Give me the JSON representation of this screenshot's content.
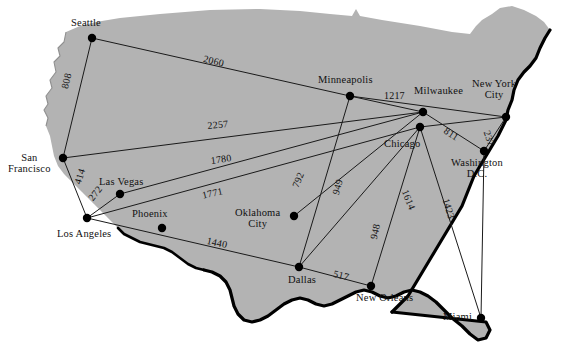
{
  "figure": {
    "kind": "weighted-graph-on-us-map",
    "land_fill": "#b3b3b3",
    "coast_stroke": "#000000",
    "edge_stroke": "#1a1a1a",
    "node_fill": "#000000",
    "background": "#ffffff"
  },
  "chart_data": {
    "type": "network-graph",
    "title": "",
    "xlabel": "",
    "ylabel": "",
    "units": "miles",
    "nodes": [
      {
        "id": "seattle",
        "label": "Seattle",
        "x": 92,
        "y": 38,
        "label_x": 71,
        "label_y": 17,
        "align": "left"
      },
      {
        "id": "san_francisco",
        "label": "San\nFrancisco",
        "x": 63,
        "y": 158,
        "label_x": 8,
        "label_y": 152,
        "align": "center"
      },
      {
        "id": "los_angeles",
        "label": "Los Angeles",
        "x": 87,
        "y": 218,
        "label_x": 57,
        "label_y": 228,
        "align": "left"
      },
      {
        "id": "las_vegas",
        "label": "Las Vegas",
        "x": 120,
        "y": 194,
        "label_x": 99,
        "label_y": 176,
        "align": "left"
      },
      {
        "id": "phoenix",
        "label": "Phoenix",
        "x": 162,
        "y": 228,
        "label_x": 132,
        "label_y": 208,
        "align": "left"
      },
      {
        "id": "dallas",
        "label": "Dallas",
        "x": 299,
        "y": 267,
        "label_x": 288,
        "label_y": 274,
        "align": "left"
      },
      {
        "id": "oklahoma_city",
        "label": "Oklahoma\nCity",
        "x": 294,
        "y": 216,
        "label_x": 235,
        "label_y": 207,
        "align": "center"
      },
      {
        "id": "minneapolis",
        "label": "Minneapolis",
        "x": 350,
        "y": 96,
        "label_x": 318,
        "label_y": 74,
        "align": "left"
      },
      {
        "id": "milwaukee",
        "label": "Milwaukee",
        "x": 423,
        "y": 112,
        "label_x": 414,
        "label_y": 85,
        "align": "left"
      },
      {
        "id": "chicago",
        "label": "Chicago",
        "x": 420,
        "y": 127,
        "label_x": 384,
        "label_y": 138,
        "align": "left"
      },
      {
        "id": "new_york_city",
        "label": "New York\nCity",
        "x": 506,
        "y": 117,
        "label_x": 472,
        "label_y": 78,
        "align": "center"
      },
      {
        "id": "washington_dc",
        "label": "Washington\nD.C.",
        "x": 484,
        "y": 151,
        "label_x": 451,
        "label_y": 157,
        "align": "center"
      },
      {
        "id": "new_orleans",
        "label": "New Orleans",
        "x": 371,
        "y": 286,
        "label_x": 356,
        "label_y": 292,
        "align": "left"
      },
      {
        "id": "miami",
        "label": "Miami",
        "x": 481,
        "y": 318,
        "label_x": 443,
        "label_y": 311,
        "align": "left"
      }
    ],
    "edges": [
      {
        "from": "seattle",
        "to": "minneapolis",
        "weight": 2060,
        "label_x": 205,
        "label_y": 53,
        "rotate": 14
      },
      {
        "from": "seattle",
        "to": "san_francisco",
        "weight": 808,
        "label_x": 59,
        "label_y": 87,
        "rotate": -76
      },
      {
        "from": "san_francisco",
        "to": "milwaukee",
        "weight": 2257,
        "label_x": 207,
        "label_y": 120,
        "rotate": -5
      },
      {
        "from": "san_francisco",
        "to": "los_angeles",
        "weight": 414,
        "label_x": 72,
        "label_y": 182,
        "rotate": -73
      },
      {
        "from": "las_vegas",
        "to": "milwaukee",
        "weight": 1780,
        "label_x": 210,
        "label_y": 155,
        "rotate": -8
      },
      {
        "from": "los_angeles",
        "to": "las_vegas",
        "weight": 272,
        "label_x": 86,
        "label_y": 196,
        "rotate": -52
      },
      {
        "from": "los_angeles",
        "to": "chicago",
        "weight": 1771,
        "label_x": 201,
        "label_y": 190,
        "rotate": -13
      },
      {
        "from": "los_angeles",
        "to": "dallas",
        "weight": 1440,
        "label_x": 208,
        "label_y": 235,
        "rotate": 12
      },
      {
        "from": "oklahoma_city",
        "to": "milwaukee",
        "weight": 792,
        "label_x": 290,
        "label_y": 185,
        "rotate": -68
      },
      {
        "from": "dallas",
        "to": "minneapolis",
        "weight": 949,
        "label_x": 330,
        "label_y": 193,
        "rotate": -75
      },
      {
        "from": "minneapolis",
        "to": "milwaukee",
        "weight": 1217,
        "label_x": 384,
        "label_y": 90,
        "rotate": 0
      },
      {
        "from": "milwaukee",
        "to": "washington_dc",
        "weight": 811,
        "label_x": 448,
        "label_y": 125,
        "rotate": 33
      },
      {
        "from": "new_york_city",
        "to": "washington_dc",
        "weight": 237,
        "label_x": 492,
        "label_y": 129,
        "rotate": 70
      },
      {
        "from": "chicago",
        "to": "miami",
        "weight": 1614,
        "label_x": 410,
        "label_y": 188,
        "rotate": 68
      },
      {
        "from": "washington_dc",
        "to": "miami",
        "weight": 1423,
        "label_x": 451,
        "label_y": 197,
        "rotate": 73
      },
      {
        "from": "chicago",
        "to": "new_orleans",
        "weight": 948,
        "label_x": 368,
        "label_y": 238,
        "rotate": -78
      },
      {
        "from": "dallas",
        "to": "new_orleans",
        "weight": 517,
        "label_x": 335,
        "label_y": 268,
        "rotate": 14
      },
      {
        "from": "dallas",
        "to": "chicago",
        "weight": null,
        "label_x": 0,
        "label_y": 0,
        "rotate": 0
      },
      {
        "from": "new_york_city",
        "to": "minneapolis",
        "weight": null,
        "label_x": 0,
        "label_y": 0,
        "rotate": 0
      },
      {
        "from": "new_york_city",
        "to": "chicago",
        "weight": null,
        "label_x": 0,
        "label_y": 0,
        "rotate": 0
      }
    ]
  }
}
